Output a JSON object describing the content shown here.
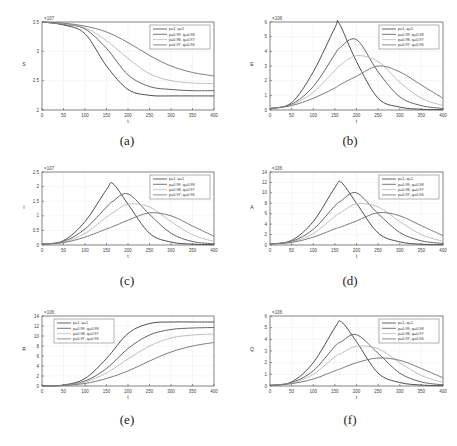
{
  "legend": [
    "p=1, q=1",
    "p=0.99, q=0.98",
    "p=0.98, q=0.97",
    "p=0.97, q=0.96"
  ],
  "series_colors": [
    "#3a3a3a",
    "#555555",
    "#b8b8b8",
    "#6e6e6e"
  ],
  "chart_data": [
    {
      "id": "a",
      "caption": "(a)",
      "type": "line",
      "xlabel": "t",
      "ylabel": "S",
      "exponent": "×10^7",
      "xlim": [
        0,
        400
      ],
      "ylim": [
        2,
        3.5
      ],
      "xticks": [
        0,
        50,
        100,
        150,
        200,
        250,
        300,
        350,
        400
      ],
      "yticks": [
        2,
        2.5,
        3,
        3.5
      ],
      "legend_position": "upper right",
      "x": [
        0,
        50,
        100,
        150,
        200,
        250,
        300,
        350,
        400
      ],
      "series": [
        {
          "name": "p=1, q=1",
          "values": [
            3.5,
            3.45,
            3.3,
            2.75,
            2.35,
            2.25,
            2.24,
            2.24,
            2.24
          ]
        },
        {
          "name": "p=0.99, q=0.98",
          "values": [
            3.5,
            3.46,
            3.38,
            3.05,
            2.6,
            2.4,
            2.35,
            2.33,
            2.33
          ]
        },
        {
          "name": "p=0.98, q=0.97",
          "values": [
            3.5,
            3.47,
            3.4,
            3.18,
            2.88,
            2.62,
            2.5,
            2.46,
            2.45
          ]
        },
        {
          "name": "p=0.97, q=0.96",
          "values": [
            3.5,
            3.48,
            3.43,
            3.33,
            3.15,
            2.93,
            2.75,
            2.64,
            2.58
          ]
        }
      ]
    },
    {
      "id": "b",
      "caption": "(b)",
      "type": "line",
      "xlabel": "t",
      "ylabel": "E",
      "exponent": "×10^6",
      "xlim": [
        0,
        400
      ],
      "ylim": [
        0,
        6
      ],
      "xticks": [
        0,
        50,
        100,
        150,
        200,
        250,
        300,
        350,
        400
      ],
      "yticks": [
        0,
        1,
        2,
        3,
        4,
        5,
        6
      ],
      "legend_position": "upper right",
      "x": [
        0,
        50,
        100,
        150,
        160,
        200,
        250,
        300,
        350,
        400
      ],
      "series": [
        {
          "name": "p=1, q=1",
          "values": [
            0.1,
            0.5,
            2.6,
            5.6,
            5.9,
            3.3,
            0.8,
            0.2,
            0.05,
            0.02
          ]
        },
        {
          "name": "p=0.99, q=0.98",
          "values": [
            0.1,
            0.4,
            1.6,
            3.8,
            4.2,
            4.8,
            2.6,
            0.9,
            0.3,
            0.1
          ]
        },
        {
          "name": "p=0.98, q=0.97",
          "values": [
            0.1,
            0.35,
            1.2,
            2.7,
            3.0,
            3.7,
            3.3,
            1.9,
            0.8,
            0.3
          ]
        },
        {
          "name": "p=0.97, q=0.96",
          "values": [
            0.1,
            0.3,
            0.8,
            1.5,
            1.7,
            2.3,
            3.0,
            2.6,
            1.7,
            0.8
          ]
        }
      ]
    },
    {
      "id": "c",
      "caption": "(c)",
      "type": "line",
      "xlabel": "t",
      "ylabel": "I",
      "exponent": "×10^7",
      "xlim": [
        0,
        400
      ],
      "ylim": [
        0,
        2.5
      ],
      "xticks": [
        0,
        50,
        100,
        150,
        200,
        250,
        300,
        350,
        400
      ],
      "yticks": [
        0,
        0.5,
        1,
        1.5,
        2,
        2.5
      ],
      "legend_position": "upper right",
      "x": [
        0,
        50,
        100,
        150,
        165,
        200,
        250,
        300,
        350,
        400
      ],
      "series": [
        {
          "name": "p=1, q=1",
          "values": [
            0.03,
            0.15,
            0.8,
            1.9,
            2.1,
            1.4,
            0.4,
            0.1,
            0.03,
            0.01
          ]
        },
        {
          "name": "p=0.99, q=0.98",
          "values": [
            0.03,
            0.12,
            0.55,
            1.3,
            1.5,
            1.75,
            1.05,
            0.4,
            0.12,
            0.04
          ]
        },
        {
          "name": "p=0.98, q=0.97",
          "values": [
            0.03,
            0.1,
            0.4,
            0.95,
            1.1,
            1.4,
            1.3,
            0.8,
            0.35,
            0.12
          ]
        },
        {
          "name": "p=0.97, q=0.96",
          "values": [
            0.03,
            0.08,
            0.27,
            0.55,
            0.63,
            0.85,
            1.1,
            1.0,
            0.65,
            0.3
          ]
        }
      ]
    },
    {
      "id": "d",
      "caption": "(d)",
      "type": "line",
      "xlabel": "t",
      "ylabel": "A",
      "exponent": "×10^6",
      "xlim": [
        0,
        400
      ],
      "ylim": [
        0,
        14
      ],
      "xticks": [
        0,
        50,
        100,
        150,
        200,
        250,
        300,
        350,
        400
      ],
      "yticks": [
        0,
        2,
        4,
        6,
        8,
        10,
        12,
        14
      ],
      "legend_position": "upper right",
      "x": [
        0,
        50,
        100,
        150,
        165,
        200,
        250,
        300,
        350,
        400
      ],
      "series": [
        {
          "name": "p=1, q=1",
          "values": [
            0.2,
            0.9,
            4.5,
            11.0,
            12.0,
            8.0,
            2.3,
            0.6,
            0.15,
            0.05
          ]
        },
        {
          "name": "p=0.99, q=0.98",
          "values": [
            0.2,
            0.7,
            3.0,
            7.5,
            8.5,
            10.0,
            6.0,
            2.4,
            0.8,
            0.3
          ]
        },
        {
          "name": "p=0.98, q=0.97",
          "values": [
            0.2,
            0.6,
            2.2,
            5.5,
            6.3,
            7.9,
            7.3,
            4.5,
            2.0,
            0.7
          ]
        },
        {
          "name": "p=0.97, q=0.96",
          "values": [
            0.2,
            0.5,
            1.5,
            3.1,
            3.5,
            4.6,
            6.2,
            5.6,
            3.7,
            1.8
          ]
        }
      ]
    },
    {
      "id": "e",
      "caption": "(e)",
      "type": "line",
      "xlabel": "t",
      "ylabel": "R",
      "exponent": "×10^6",
      "xlim": [
        0,
        400
      ],
      "ylim": [
        0,
        14
      ],
      "xticks": [
        0,
        50,
        100,
        150,
        200,
        250,
        300,
        350,
        400
      ],
      "yticks": [
        0,
        2,
        4,
        6,
        8,
        10,
        12,
        14
      ],
      "legend_position": "upper left",
      "x": [
        0,
        50,
        100,
        150,
        200,
        250,
        300,
        350,
        400
      ],
      "series": [
        {
          "name": "p=1, q=1",
          "values": [
            0,
            0.2,
            1.5,
            5.5,
            10.5,
            12.5,
            12.8,
            12.8,
            12.8
          ]
        },
        {
          "name": "p=0.99, q=0.98",
          "values": [
            0,
            0.15,
            1.0,
            3.5,
            7.5,
            10.2,
            11.3,
            11.6,
            11.7
          ]
        },
        {
          "name": "p=0.98, q=0.97",
          "values": [
            0,
            0.12,
            0.8,
            2.6,
            5.4,
            8.0,
            9.6,
            10.2,
            10.4
          ]
        },
        {
          "name": "p=0.97, q=0.96",
          "values": [
            0,
            0.1,
            0.5,
            1.5,
            3.0,
            5.0,
            6.8,
            8.0,
            8.7
          ]
        }
      ]
    },
    {
      "id": "f",
      "caption": "(f)",
      "type": "line",
      "xlabel": "t",
      "ylabel": "Q",
      "exponent": "×10^6",
      "xlim": [
        0,
        400
      ],
      "ylim": [
        0,
        6
      ],
      "xticks": [
        0,
        50,
        100,
        150,
        200,
        250,
        300,
        350,
        400
      ],
      "yticks": [
        0,
        1,
        2,
        3,
        4,
        5,
        6
      ],
      "legend_position": "upper right",
      "x": [
        0,
        50,
        100,
        150,
        165,
        200,
        250,
        300,
        350,
        400
      ],
      "series": [
        {
          "name": "p=1, q=1",
          "values": [
            0.05,
            0.35,
            2.0,
            5.0,
            5.5,
            3.8,
            1.1,
            0.3,
            0.08,
            0.02
          ]
        },
        {
          "name": "p=0.99, q=0.98",
          "values": [
            0.05,
            0.3,
            1.3,
            3.4,
            3.8,
            4.4,
            2.8,
            1.1,
            0.35,
            0.1
          ]
        },
        {
          "name": "p=0.98, q=0.97",
          "values": [
            0.05,
            0.25,
            1.0,
            2.5,
            2.8,
            3.4,
            3.2,
            2.0,
            0.9,
            0.3
          ]
        },
        {
          "name": "p=0.97, q=0.96",
          "values": [
            0.05,
            0.2,
            0.6,
            1.3,
            1.5,
            2.0,
            2.4,
            2.2,
            1.5,
            0.7
          ]
        }
      ]
    }
  ]
}
